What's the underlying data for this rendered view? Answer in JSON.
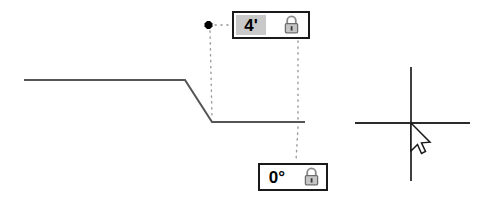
{
  "app": {
    "title": "CAD Polyline Dimension Entry"
  },
  "dimension_inputs": [
    {
      "id": "length",
      "name": "length-dimension-field",
      "value": "4'",
      "unit": "feet",
      "placeholder": "0'",
      "highlighted": true,
      "lock": {
        "name": "lock-length-toggle",
        "icon": "lock-closed-icon",
        "state": "unlocked",
        "label": "Lock length"
      }
    },
    {
      "id": "angle",
      "name": "angle-dimension-field",
      "value": "0°",
      "unit": "degrees",
      "placeholder": "0°",
      "highlighted": false,
      "lock": {
        "name": "lock-angle-toggle",
        "icon": "lock-closed-icon",
        "state": "unlocked",
        "label": "Lock angle"
      }
    }
  ],
  "geometry": {
    "polyline": {
      "name": "drawn-polyline",
      "color": "#555555",
      "width": 2,
      "points": "24,80 185,80 212,122 305,122"
    },
    "guides": [
      {
        "name": "vertical-guide-left",
        "x1": 209,
        "y1": 30,
        "x2": 212,
        "y2": 118,
        "color": "#9a9a9a"
      },
      {
        "name": "horizontal-guide-top",
        "x1": 214,
        "y1": 25,
        "x2": 232,
        "y2": 25,
        "color": "#9a9a9a"
      },
      {
        "name": "vertical-guide-right-upper",
        "x1": 298,
        "y1": 41,
        "x2": 298,
        "y2": 120,
        "color": "#9a9a9a"
      },
      {
        "name": "vertical-guide-right-lower",
        "x1": 298,
        "y1": 126,
        "x2": 296,
        "y2": 161,
        "color": "#9a9a9a"
      }
    ],
    "snap_marker": {
      "name": "snap-point-marker",
      "x": 208,
      "y": 25,
      "color": "#000000"
    }
  },
  "cursor": {
    "name": "crosshair-cursor",
    "x": 411,
    "y": 123,
    "color": "#2b2b2b",
    "horizontal_span": [
      355,
      470
    ],
    "vertical_span": [
      67,
      181
    ],
    "pointer": {
      "name": "arrow-pointer-icon",
      "tip_x": 411,
      "tip_y": 123
    }
  },
  "colors": {
    "line": "#555555",
    "guide": "#9a9a9a",
    "cursor": "#2b2b2b",
    "box_border": "#1a1a1a",
    "highlight_bg": "#c9c9c9",
    "canvas_bg": "#ffffff"
  }
}
